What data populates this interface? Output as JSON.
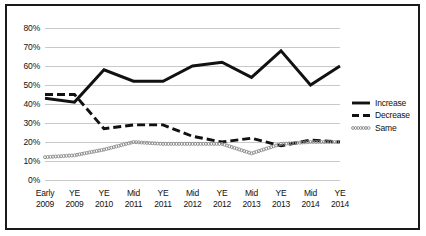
{
  "chart_data": {
    "type": "line",
    "title": "",
    "xlabel": "",
    "ylabel": "",
    "grid": true,
    "legend_position": "right",
    "ylim": [
      0,
      80
    ],
    "ytick_labels": [
      "80%",
      "70%",
      "60%",
      "50%",
      "40%",
      "30%",
      "20%",
      "10%",
      "0%"
    ],
    "ytick_values": [
      80,
      70,
      60,
      50,
      40,
      30,
      20,
      10,
      0
    ],
    "categories": [
      "Early 2009",
      "YE 2009",
      "YE 2010",
      "Mid 2011",
      "YE 2011",
      "Mid 2012",
      "YE 2012",
      "Mid 2013",
      "YE 2013",
      "Mid 2014",
      "YE 2014"
    ],
    "category_lines": [
      [
        "Early",
        "2009"
      ],
      [
        "YE",
        "2009"
      ],
      [
        "YE",
        "2010"
      ],
      [
        "Mid",
        "2011"
      ],
      [
        "YE",
        "2011"
      ],
      [
        "Mid",
        "2012"
      ],
      [
        "YE",
        "2012"
      ],
      [
        "Mid",
        "2013"
      ],
      [
        "YE",
        "2013"
      ],
      [
        "Mid",
        "2014"
      ],
      [
        "YE",
        "2014"
      ]
    ],
    "series": [
      {
        "name": "Increase",
        "style": "solid",
        "color": "#111111",
        "values": [
          43,
          41,
          58,
          52,
          52,
          60,
          62,
          54,
          68,
          50,
          60
        ]
      },
      {
        "name": "Decrease",
        "style": "dashed",
        "color": "#111111",
        "values": [
          45,
          45,
          27,
          29,
          29,
          23,
          20,
          22,
          18,
          21,
          20
        ]
      },
      {
        "name": "Same",
        "style": "dotted",
        "color": "#888888",
        "values": [
          12,
          13,
          16,
          20,
          19,
          19,
          19,
          14,
          19,
          20,
          20
        ]
      }
    ]
  },
  "legend": {
    "items": [
      {
        "label": "Increase",
        "style": "solid"
      },
      {
        "label": "Decrease",
        "style": "dashed"
      },
      {
        "label": "Same",
        "style": "dotted"
      }
    ]
  },
  "colors": {
    "border": "#1a1a1a",
    "gridline": "#c9c9c9",
    "axis_text": "#111111",
    "series_dark": "#111111",
    "series_light": "#888888",
    "background": "#ffffff"
  }
}
